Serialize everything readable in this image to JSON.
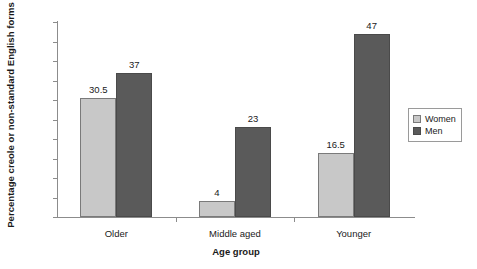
{
  "chart_data": {
    "type": "bar",
    "title": "",
    "subtitle": "",
    "xlabel": "Age group",
    "ylabel": "Percentage creole or non-standard English forms",
    "categories": [
      "Older",
      "Middle aged",
      "Younger"
    ],
    "series": [
      {
        "name": "Women",
        "values": [
          30.5,
          4,
          16.5
        ],
        "color": "#c8c8c8"
      },
      {
        "name": "Men",
        "values": [
          37,
          23,
          47
        ],
        "color": "#5a5a5a"
      }
    ],
    "value_labels": [
      [
        "30.5",
        "4",
        "16.5"
      ],
      [
        "37",
        "23",
        "47"
      ]
    ],
    "ylim": [
      0,
      50
    ],
    "ytick_values": [
      0,
      5,
      10,
      15,
      20,
      25,
      30,
      35,
      40,
      45,
      50
    ],
    "ytick_labels": [
      "0",
      "5",
      "10",
      "15",
      "20",
      "25",
      "30",
      "35",
      "40",
      "45",
      "50"
    ],
    "grid": false,
    "legend_position": "right",
    "legend_entries": [
      "Women",
      "Men"
    ],
    "background_color": "#ffffff",
    "axis_color": "#8c8c8c"
  }
}
